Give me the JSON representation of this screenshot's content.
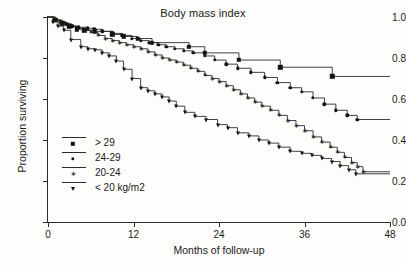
{
  "chart_data": {
    "type": "line",
    "subtype": "kaplan-meier-step",
    "title": "Body mass index",
    "xlabel": "Months of follow-up",
    "ylabel": "Proportion surviving",
    "xlim": [
      0,
      48
    ],
    "ylim": [
      0.0,
      1.0
    ],
    "xticks": [
      0,
      12,
      24,
      36,
      48
    ],
    "xtick_labels": [
      "0",
      "12",
      "24",
      "36",
      "48"
    ],
    "yticks": [
      0.0,
      0.2,
      0.4,
      0.6,
      0.8,
      1.0
    ],
    "ytick_labels": [
      "0.0",
      "0.2",
      "0.4",
      "0.6",
      "0.8",
      "1.0"
    ],
    "grid": false,
    "legend_position": "lower-left-inside",
    "series": [
      {
        "name": "> 29",
        "marker": "square",
        "x": [
          0,
          1.1,
          2.0,
          3.0,
          4.0,
          5.1,
          6.6,
          9.0,
          10.6,
          12.6,
          14.6,
          19.8,
          22.0,
          26.8,
          32.6,
          39.9,
          48.0
        ],
        "y": [
          1.0,
          0.985,
          0.97,
          0.955,
          0.94,
          0.935,
          0.93,
          0.915,
          0.905,
          0.895,
          0.875,
          0.855,
          0.825,
          0.79,
          0.755,
          0.71,
          0.71
        ]
      },
      {
        "name": "24-29",
        "marker": "circle",
        "x": [
          0,
          0.9,
          1.8,
          2.6,
          3.4,
          4.3,
          5.6,
          6.5,
          7.6,
          9.1,
          10.4,
          11.8,
          13.0,
          14.2,
          15.5,
          16.6,
          17.8,
          19.1,
          20.4,
          22.0,
          23.4,
          25.0,
          26.6,
          28.5,
          30.4,
          32.2,
          34.0,
          35.6,
          37.2,
          38.8,
          40.4,
          42.0,
          43.4,
          48.0
        ],
        "y": [
          1.0,
          0.985,
          0.975,
          0.965,
          0.955,
          0.95,
          0.945,
          0.94,
          0.93,
          0.92,
          0.91,
          0.895,
          0.885,
          0.875,
          0.865,
          0.855,
          0.845,
          0.835,
          0.825,
          0.81,
          0.79,
          0.77,
          0.75,
          0.73,
          0.705,
          0.68,
          0.655,
          0.635,
          0.605,
          0.575,
          0.545,
          0.52,
          0.5,
          0.5
        ]
      },
      {
        "name": "20-24",
        "marker": "star",
        "x": [
          0,
          0.8,
          1.6,
          2.4,
          3.2,
          4.1,
          5.0,
          6.0,
          7.0,
          8.0,
          9.0,
          10.0,
          11.0,
          12.0,
          13.0,
          14.0,
          15.0,
          16.0,
          17.0,
          18.0,
          19.0,
          20.0,
          21.0,
          22.0,
          23.0,
          24.0,
          25.0,
          26.0,
          27.0,
          28.0,
          29.0,
          30.0,
          31.2,
          32.4,
          33.6,
          34.8,
          36.0,
          37.2,
          38.4,
          39.6,
          40.6,
          41.6,
          42.6,
          43.4,
          44.2,
          48.0
        ],
        "y": [
          1.0,
          0.985,
          0.975,
          0.965,
          0.955,
          0.945,
          0.935,
          0.925,
          0.91,
          0.895,
          0.885,
          0.875,
          0.865,
          0.855,
          0.845,
          0.83,
          0.815,
          0.8,
          0.79,
          0.78,
          0.765,
          0.75,
          0.735,
          0.715,
          0.7,
          0.685,
          0.665,
          0.645,
          0.625,
          0.605,
          0.585,
          0.565,
          0.545,
          0.52,
          0.495,
          0.47,
          0.445,
          0.415,
          0.39,
          0.365,
          0.34,
          0.315,
          0.29,
          0.27,
          0.245,
          0.245
        ]
      },
      {
        "name": "< 20 kg/m2",
        "marker": "triangle-down",
        "x": [
          0,
          0.7,
          1.4,
          2.2,
          3.2,
          4.6,
          5.6,
          6.6,
          7.6,
          8.6,
          9.6,
          10.6,
          11.8,
          13.0,
          14.0,
          15.0,
          16.0,
          17.0,
          18.0,
          19.2,
          20.6,
          22.2,
          23.8,
          25.2,
          26.6,
          28.2,
          29.6,
          31.0,
          32.4,
          34.0,
          35.6,
          37.0,
          38.4,
          39.8,
          41.0,
          42.2,
          43.2,
          48.0
        ],
        "y": [
          1.0,
          0.975,
          0.955,
          0.935,
          0.89,
          0.855,
          0.845,
          0.84,
          0.825,
          0.81,
          0.785,
          0.745,
          0.7,
          0.655,
          0.64,
          0.625,
          0.61,
          0.59,
          0.565,
          0.535,
          0.515,
          0.5,
          0.475,
          0.46,
          0.435,
          0.42,
          0.4,
          0.385,
          0.365,
          0.345,
          0.335,
          0.325,
          0.31,
          0.295,
          0.275,
          0.255,
          0.235,
          0.235
        ]
      }
    ]
  },
  "legend": {
    "entries": [
      {
        "label": "> 29",
        "marker": "square-marker"
      },
      {
        "label": "24-29",
        "marker": "circle-marker"
      },
      {
        "label": "20-24",
        "marker": "star-marker"
      },
      {
        "label": "< 20 kg/m2",
        "marker": "triangle-down-marker"
      }
    ]
  }
}
